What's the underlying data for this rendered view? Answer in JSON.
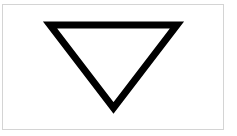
{
  "figure": {
    "shape": "inverted-triangle",
    "stroke_color": "#000000",
    "fill_color": "#ffffff",
    "border_color": "#d4d4d4",
    "points": "50,25 177,25 113.5,108",
    "stroke_width": "7"
  }
}
